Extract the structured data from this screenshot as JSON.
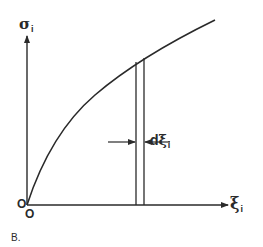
{
  "diagram": {
    "panel_label": "B.",
    "y_axis": {
      "symbol": "σ",
      "subscript": "i"
    },
    "x_axis": {
      "symbol": "ξ",
      "subscript": "i"
    },
    "origin_labels": [
      "O",
      "O"
    ],
    "strip_label": {
      "prefix": "d",
      "symbol": "ξ",
      "subscript": "i"
    },
    "line_color": "#2a2a2a",
    "background": "#ffffff"
  }
}
